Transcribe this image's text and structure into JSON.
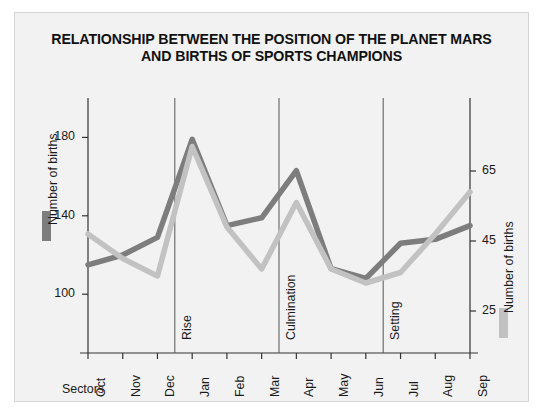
{
  "figure": {
    "title_line1": "RELATIONSHIP BETWEEN THE POSITION OF THE PLANET MARS",
    "title_line2": "AND BIRTHS OF SPORTS CHAMPIONS",
    "background": "#f2f2f2",
    "border_color": "#d6d6d6"
  },
  "chart_data": {
    "type": "line",
    "title": "RELATIONSHIP BETWEEN THE POSITION OF THE PLANET MARS AND BIRTHS OF SPORTS CHAMPIONS",
    "xlabel": "Sectors",
    "categories": [
      "Oct",
      "Nov",
      "Dec",
      "Jan",
      "Feb",
      "Mar",
      "Apr",
      "May",
      "Jun",
      "Jul",
      "Aug",
      "Sep"
    ],
    "grid": false,
    "legend_position": "axis-titles",
    "series": [
      {
        "name": "Number of births",
        "axis": "left",
        "color": "#7d7d7d",
        "ylabel": "Number of births",
        "ylim": [
          70,
          195
        ],
        "yticks": [
          100,
          140,
          180
        ],
        "values": [
          115,
          120,
          129,
          179,
          135,
          139,
          163,
          113,
          108,
          126,
          128,
          135
        ]
      },
      {
        "name": "Number of births",
        "axis": "right",
        "color": "#c2c2c2",
        "ylabel": "Number of births",
        "ylim": [
          13,
          83
        ],
        "yticks": [
          25,
          45,
          65
        ],
        "values": [
          47,
          40,
          35,
          72,
          49,
          37,
          56,
          37,
          33,
          36,
          47,
          59
        ]
      }
    ],
    "annotations": [
      {
        "label": "Rise",
        "at_category": "Jan",
        "position_offset": -0.5
      },
      {
        "label": "Culmination",
        "at_category": "Apr",
        "position_offset": -0.5
      },
      {
        "label": "Setting",
        "at_category": "Jul",
        "position_offset": -0.5
      }
    ]
  }
}
